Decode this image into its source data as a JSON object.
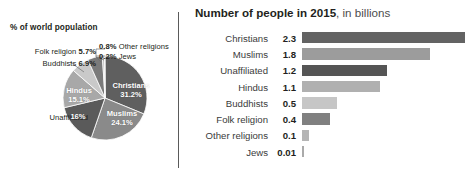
{
  "pie": {
    "caption": "% of world population",
    "slices": [
      {
        "name": "Christians",
        "label": "Christians",
        "pct_label": "31.2%",
        "value": 31.2,
        "color": "#5f5f5f",
        "placement": "inside"
      },
      {
        "name": "Muslims",
        "label": "Muslims",
        "pct_label": "24.1%",
        "value": 24.1,
        "color": "#8a8a8a",
        "placement": "inside"
      },
      {
        "name": "Unaffiliated",
        "label": "Unaffiliated",
        "pct_label": "16%",
        "value": 16.0,
        "color": "#5a5a5a",
        "placement": "inside"
      },
      {
        "name": "Hindus",
        "label": "Hindus",
        "pct_label": "15.1%",
        "value": 15.1,
        "color": "#a8a8a8",
        "placement": "inside"
      },
      {
        "name": "Buddhists",
        "label": "Buddhists",
        "pct_label": "6.9%",
        "value": 6.9,
        "color": "#c9c9c9",
        "placement": "outside"
      },
      {
        "name": "Folk religion",
        "label": "Folk religion",
        "pct_label": "5.7%",
        "value": 5.7,
        "color": "#7a7a7a",
        "placement": "outside"
      },
      {
        "name": "Other religions",
        "label": "Other religions",
        "pct_label": "0.8%",
        "value": 0.8,
        "color": "#bdbdbd",
        "placement": "outside"
      },
      {
        "name": "Jews",
        "label": "Jews",
        "pct_label": "0.2%",
        "value": 0.2,
        "color": "#9a9a9a",
        "placement": "outside"
      }
    ],
    "callouts": {
      "folk": {
        "value": "5.7%",
        "name": "Folk religion"
      },
      "budd": {
        "value": "6.9%",
        "name": "Buddhists"
      },
      "unaff": {
        "name": "Unaffiliated",
        "inside": "16%"
      },
      "other": {
        "value": "0.8%",
        "name": "Other religions"
      },
      "jews": {
        "value": "0.2%",
        "name": "Jews"
      }
    }
  },
  "bar": {
    "title_strong": "Number of people in 2015",
    "title_light": ", in billions"
  },
  "chart_data": [
    {
      "type": "pie",
      "title": "% of world population",
      "categories": [
        "Christians",
        "Muslims",
        "Unaffiliated",
        "Hindus",
        "Buddhists",
        "Folk religion",
        "Other religions",
        "Jews"
      ],
      "values": [
        31.2,
        24.1,
        16.0,
        15.1,
        6.9,
        5.7,
        0.8,
        0.2
      ],
      "unit": "percent",
      "legend": "none",
      "annotations": [
        "Christians 31.2%",
        "Muslims 24.1%",
        "Unaffiliated 16%",
        "Hindus 15.1%",
        "Buddhists 6.9%",
        "Folk religion 5.7%",
        "0.8% Other religions",
        "0.2% Jews"
      ]
    },
    {
      "type": "bar",
      "orientation": "horizontal",
      "title": "Number of people in 2015, in billions",
      "ylabel": "",
      "xlabel": "billions",
      "grid": false,
      "legend": "none",
      "xlim": [
        0,
        2.3
      ],
      "categories": [
        "Christians",
        "Muslims",
        "Unaffiliated",
        "Hindus",
        "Buddhists",
        "Folk religion",
        "Other religions",
        "Jews"
      ],
      "values": [
        2.3,
        1.8,
        1.2,
        1.1,
        0.5,
        0.4,
        0.1,
        0.01
      ],
      "value_labels": [
        "2.3",
        "1.8",
        "1.2",
        "1.1",
        "0.5",
        "0.4",
        "0.1",
        "0.01"
      ],
      "colors": [
        "#636363",
        "#9c9c9c",
        "#555555",
        "#b0b0b0",
        "#c6c6c6",
        "#808080",
        "#b5b5b5",
        "#aaaaaa"
      ]
    }
  ]
}
